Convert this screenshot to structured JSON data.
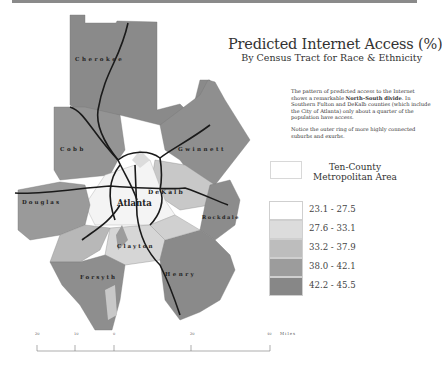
{
  "title": "Predicted Internet Access (%)",
  "subtitle": "By Census Tract for Race & Ethnicity",
  "description": {
    "paragraph1_before": "The pattern of predicted access to the Internet shows a remarkable ",
    "paragraph1_bold": "North–South divide",
    "paragraph1_after": ". In Southern Fulton and DeKalb counties (which include the City of Atlanta) only about a quarter of the population have access.",
    "paragraph2": "Notice the outer ring of more highly connected suburbs and exurbs."
  },
  "area_legend": {
    "label_line1": "Ten-County",
    "label_line2": "Metropolitan Area"
  },
  "legend": [
    {
      "range": "23.1 - 27.5",
      "color": "#ffffff"
    },
    {
      "range": "27.6 - 33.1",
      "color": "#dcdcdc"
    },
    {
      "range": "33.2 - 37.9",
      "color": "#bdbdbd"
    },
    {
      "range": "38.0 - 42.1",
      "color": "#9c9c9c"
    },
    {
      "range": "42.2 - 45.5",
      "color": "#878787"
    }
  ],
  "map": {
    "county_labels": [
      "Cherokee",
      "Cobb",
      "Gwinnett",
      "DeKalb",
      "Douglas",
      "Atlanta",
      "Rockdale",
      "Clayton",
      "Forsyth",
      "Henry"
    ]
  },
  "scale_bar": {
    "ticks": [
      "20",
      "10",
      "0",
      "20",
      "40"
    ],
    "unit": "Miles"
  }
}
